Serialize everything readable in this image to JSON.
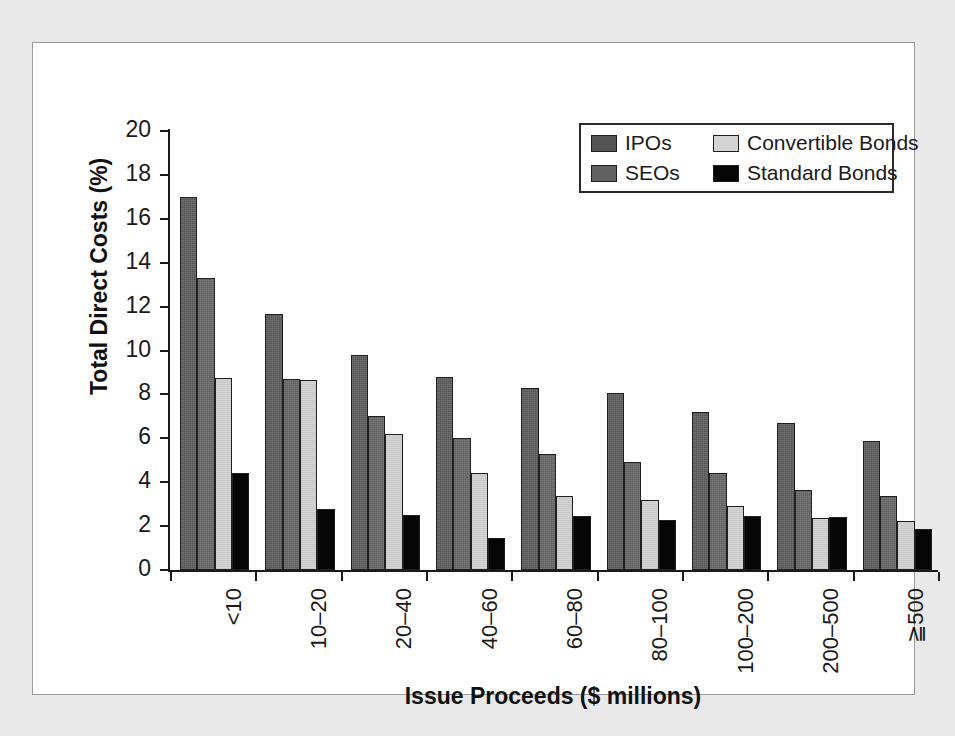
{
  "figure": {
    "panel_background": "#ffffff",
    "page_background": "#e9e9e9",
    "frame_color": "#9a9a9a"
  },
  "chart_data": {
    "type": "bar",
    "title": "",
    "xlabel": "Issue Proceeds ($ millions)",
    "ylabel": "Total Direct Costs (%)",
    "ylim": [
      0,
      20
    ],
    "ytick_step": 2,
    "yticks": [
      0,
      2,
      4,
      6,
      8,
      10,
      12,
      14,
      16,
      18,
      20
    ],
    "grid": false,
    "legend_position": "top-right",
    "categories": [
      "<10",
      "10–20",
      "20–40",
      "40–60",
      "60–80",
      "80–100",
      "100–200",
      "200–500",
      "≧500"
    ],
    "series": [
      {
        "name": "IPOs",
        "color": "#555555",
        "values": [
          17.0,
          11.65,
          9.8,
          8.8,
          8.3,
          8.05,
          7.2,
          6.7,
          5.9
        ]
      },
      {
        "name": "SEOs",
        "color": "#606060",
        "values": [
          13.3,
          8.7,
          7.0,
          6.0,
          5.3,
          4.9,
          4.4,
          3.65,
          3.35
        ]
      },
      {
        "name": "Convertible Bonds",
        "color": "#d4d4d4",
        "values": [
          8.75,
          8.65,
          6.2,
          4.4,
          3.35,
          3.2,
          2.9,
          2.35,
          2.25
        ]
      },
      {
        "name": "Standard Bonds",
        "color": "#060606",
        "values": [
          4.4,
          2.8,
          2.5,
          1.45,
          2.45,
          2.3,
          2.45,
          2.4,
          1.85
        ]
      }
    ]
  }
}
